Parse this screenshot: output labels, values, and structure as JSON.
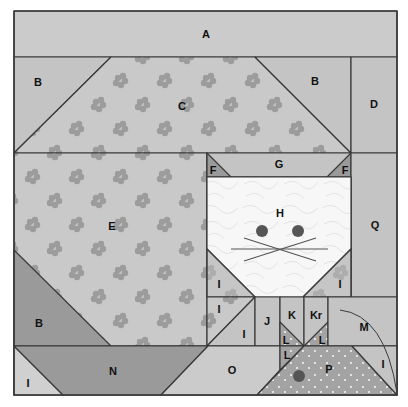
{
  "colors": {
    "background_light": "#cbcbcb",
    "background_mid": "#bdbdbd",
    "dark_piece": "#9a9a9a",
    "flower_fabric_base": "#c9c9c9",
    "flower_motif": "#999999",
    "face_white": "#f7f7f7",
    "outline": "#3a3a3a",
    "eye": "#555555",
    "dot_fabric": "#a3a3a3"
  },
  "pieces": {
    "A": "A",
    "B_top_left": "B",
    "C": "C",
    "B_top_right": "B",
    "D": "D",
    "E": "E",
    "F_left": "F",
    "G": "G",
    "F_right": "F",
    "H": "H",
    "Q": "Q",
    "I_face_left": "I",
    "I_face_right": "I",
    "B_bottom_left": "B",
    "I_row2_top": "I",
    "I_row2_bottom": "I",
    "J": "J",
    "K": "K",
    "Kr": "Kr",
    "L_left": "L",
    "L_right": "L",
    "L_bottom": "L",
    "M": "M",
    "I_bottom_left": "I",
    "N": "N",
    "O": "O",
    "P": "P",
    "I_bottom_right": "I"
  }
}
